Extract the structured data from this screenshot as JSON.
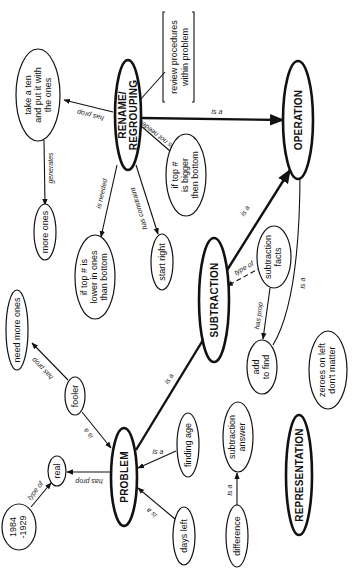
{
  "nodes": {
    "rename": {
      "line1": "RENAME/",
      "line2": "REGROUPING"
    },
    "take_ten": {
      "line1": "take a ten",
      "line2": "and put it with",
      "line3": "the ones"
    },
    "review": {
      "line1": "review procedures",
      "line2": "within problem"
    },
    "operation": {
      "label": "OPERATION"
    },
    "top_bigger": {
      "line1": "if top #",
      "line2": "is bigger",
      "line3": "then bottom"
    },
    "more_ones": {
      "label": "more ones"
    },
    "top_lower": {
      "line1": "if top # is",
      "line2": "lower in ones",
      "line3": "than bottom"
    },
    "start_right": {
      "label": "start right"
    },
    "subtraction": {
      "label": "SUBTRACTION"
    },
    "sub_facts": {
      "line1": "subtraction",
      "line2": "facts"
    },
    "add_find": {
      "line1": "add",
      "line2": "to find"
    },
    "zeroes": {
      "line1": "zeroes on left",
      "line2": "don't matter"
    },
    "need_more": {
      "label": "need more ones"
    },
    "fooler": {
      "label": "fooler"
    },
    "problem": {
      "label": "PROBLEM"
    },
    "real": {
      "label": "real"
    },
    "years": {
      "line1": "1984",
      "line2": "-1929"
    },
    "finding_age": {
      "label": "finding age"
    },
    "days_left": {
      "label": "days left"
    },
    "sub_answer": {
      "line1": "subtraction",
      "line2": "answer"
    },
    "difference": {
      "label": "difference"
    },
    "representation": {
      "label": "REPRESENTATION"
    }
  },
  "edges": {
    "rename_takeTen": "has prop",
    "rename_operation": "is a",
    "rename_topBigger": "is not needed",
    "rename_topLower": "is needed",
    "rename_startRight": "has constraint",
    "takeTen_moreOnes": "generates",
    "subtraction_operation": "is a",
    "subFacts_subtraction": "type of",
    "subFacts_addFind": "has prop",
    "addFind_operation": "is a",
    "problem_subtraction": "is a",
    "fooler_needMore": "has prop",
    "fooler_problem": "is a",
    "problem_real": "has prop",
    "years_real": "type of",
    "findingAge_problem": "is a",
    "daysLeft_problem": "is a",
    "difference_subAnswer": "is a"
  }
}
